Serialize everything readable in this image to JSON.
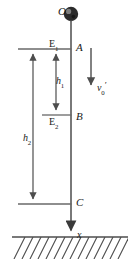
{
  "figure": {
    "background_color": "#ffffff",
    "stroke_color": "#4d4d4d",
    "text_color": "#1a1a1a",
    "width": 137,
    "height": 264
  },
  "labels": {
    "origin": "O",
    "level_upper_energy": "E",
    "level_upper_energy_sub": "1",
    "point_a": "A",
    "height_1": "h",
    "height_1_sub": "1",
    "velocity": "v",
    "velocity_sub": "0",
    "velocity_prime": "′",
    "point_b": "B",
    "level_lower_energy": "E",
    "level_lower_energy_sub": "2",
    "height_2": "h",
    "height_2_sub": "2",
    "point_c": "C",
    "axis_x": "x"
  },
  "geometry": {
    "ball": {
      "cx": 71,
      "cy": 14,
      "r": 7
    },
    "main_axis": {
      "x": 71,
      "y_top": 21,
      "y_bottom": 237
    },
    "level_a": {
      "x1": 18,
      "x2": 71,
      "y": 49
    },
    "level_b": {
      "x1": 42,
      "x2": 71,
      "y": 115
    },
    "level_c": {
      "x1": 18,
      "x2": 71,
      "y": 204
    },
    "ground": {
      "x1": 12,
      "x2": 128,
      "y": 237
    },
    "arrow_h1": {
      "x": 56,
      "y_top": 52,
      "y_bottom": 113
    },
    "arrow_h2": {
      "x": 33,
      "y_top": 52,
      "y_bottom": 202
    },
    "arrow_v0": {
      "x": 91,
      "y_top": 48,
      "y_bottom": 88
    },
    "hatch_count": 14
  }
}
